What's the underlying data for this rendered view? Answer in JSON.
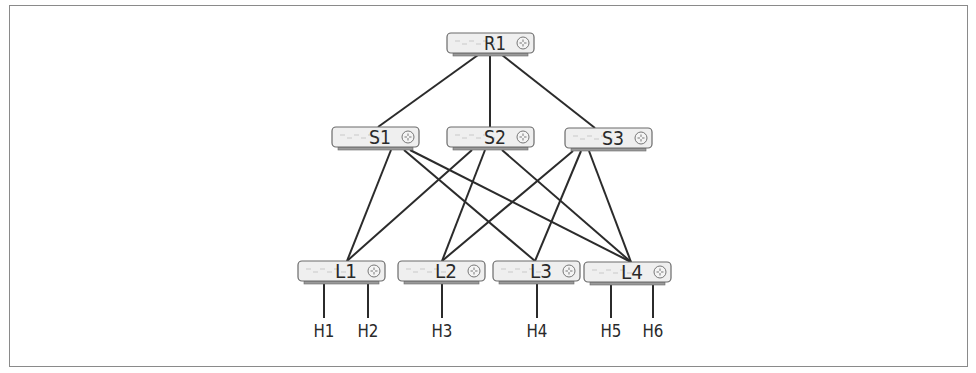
{
  "diagram": {
    "title": "",
    "colors": {
      "line": "#2b2b2b",
      "device_fill": "#efefef",
      "device_stroke": "#6a6a6a",
      "frame": "#8a8a8a",
      "text": "#2a2a2a"
    },
    "nodes": [
      {
        "id": "R1",
        "label": "R1",
        "type": "router",
        "tier": "root"
      },
      {
        "id": "S1",
        "label": "S1",
        "type": "router",
        "tier": "spine"
      },
      {
        "id": "S2",
        "label": "S2",
        "type": "router",
        "tier": "spine"
      },
      {
        "id": "S3",
        "label": "S3",
        "type": "router",
        "tier": "spine"
      },
      {
        "id": "L1",
        "label": "L1",
        "type": "router",
        "tier": "leaf"
      },
      {
        "id": "L2",
        "label": "L2",
        "type": "router",
        "tier": "leaf"
      },
      {
        "id": "L3",
        "label": "L3",
        "type": "router",
        "tier": "leaf"
      },
      {
        "id": "L4",
        "label": "L4",
        "type": "router",
        "tier": "leaf"
      },
      {
        "id": "H1",
        "label": "H1",
        "type": "host",
        "tier": "host"
      },
      {
        "id": "H2",
        "label": "H2",
        "type": "host",
        "tier": "host"
      },
      {
        "id": "H3",
        "label": "H3",
        "type": "host",
        "tier": "host"
      },
      {
        "id": "H4",
        "label": "H4",
        "type": "host",
        "tier": "host"
      },
      {
        "id": "H5",
        "label": "H5",
        "type": "host",
        "tier": "host"
      },
      {
        "id": "H6",
        "label": "H6",
        "type": "host",
        "tier": "host"
      }
    ],
    "edges": [
      [
        "R1",
        "S1"
      ],
      [
        "R1",
        "S2"
      ],
      [
        "R1",
        "S3"
      ],
      [
        "S1",
        "L1"
      ],
      [
        "S1",
        "L3"
      ],
      [
        "S1",
        "L4"
      ],
      [
        "S2",
        "L1"
      ],
      [
        "S2",
        "L2"
      ],
      [
        "S2",
        "L4"
      ],
      [
        "S3",
        "L2"
      ],
      [
        "S3",
        "L3"
      ],
      [
        "S3",
        "L4"
      ],
      [
        "L1",
        "H1"
      ],
      [
        "L1",
        "H2"
      ],
      [
        "L2",
        "H3"
      ],
      [
        "L3",
        "H4"
      ],
      [
        "L4",
        "H5"
      ],
      [
        "L4",
        "H6"
      ]
    ]
  }
}
